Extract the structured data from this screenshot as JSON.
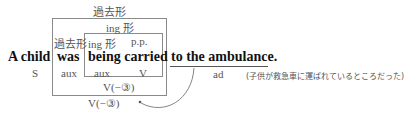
{
  "diagram": {
    "outer_box_label": "過去形",
    "inner_box_label": "ing 形",
    "labels_row": {
      "was_label": "過去形",
      "being_label": "ing 形",
      "carried_label": "p.p."
    },
    "sentence": {
      "subject": "A child",
      "aux1": "was",
      "verb_phrase": "being carried",
      "adverbial": "to the ambulance."
    },
    "roles": {
      "subject": "S",
      "aux1": "aux",
      "aux2": "aux",
      "verb": "V",
      "adverbial": "ad"
    },
    "inner_verb_pattern": "V(−③)",
    "outer_verb_pattern": "V(−③)",
    "translation": "(子供が救急車に運ばれているところだった)",
    "colors": {
      "box_border": "#8a8a8a",
      "label_text": "#555555",
      "main_text": "#111111",
      "arrow": "#777777"
    }
  }
}
